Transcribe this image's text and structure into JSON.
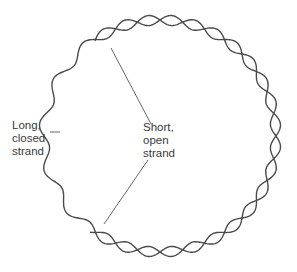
{
  "diagram": {
    "title": "",
    "colors": {
      "strand": "#4a4a4a",
      "leader": "#555555",
      "text": "#3a3a3a",
      "background": "#ffffff"
    },
    "circle": {
      "cx": 160,
      "cy": 136,
      "r": 116,
      "wave_amplitude": 5,
      "waves": 16
    },
    "labels": {
      "long_strand": {
        "lines": [
          "Long,",
          "closed",
          "strand"
        ]
      },
      "short_strand": {
        "lines": [
          "Short,",
          "open",
          "strand"
        ]
      }
    },
    "nodes": [
      {
        "id": "long-closed-strand",
        "label": "Long, closed strand",
        "shape": "closed wavy circle"
      },
      {
        "id": "short-open-strand",
        "label": "Short, open strand",
        "shape": "open wavy arc twisting around right half of circle"
      }
    ],
    "edges": [
      {
        "from": "long_strand_label",
        "to": "long-closed-strand",
        "type": "leader-line"
      },
      {
        "from": "short_strand_label",
        "to": "short-open-strand-start",
        "type": "leader-line"
      },
      {
        "from": "short_strand_label",
        "to": "short-open-strand-end",
        "type": "leader-line"
      }
    ]
  }
}
